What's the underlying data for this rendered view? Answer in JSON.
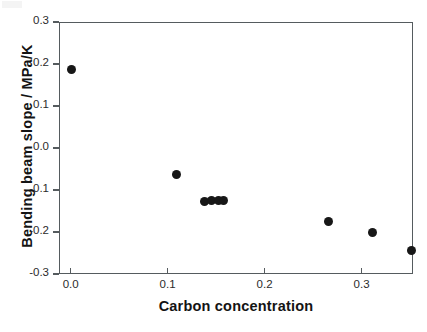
{
  "chart_data": {
    "type": "scatter",
    "title": "",
    "xlabel": "Carbon concentration",
    "ylabel": "Bending beam slope / MPa/K",
    "xlim": [
      -0.012,
      0.353
    ],
    "ylim": [
      -0.3,
      0.3
    ],
    "xticks": [
      0.0,
      0.1,
      0.2,
      0.3
    ],
    "xticklabels": [
      "0.0",
      "0.1",
      "0.2",
      "0.3"
    ],
    "yticks": [
      -0.3,
      -0.2,
      -0.1,
      0.0,
      0.1,
      0.2,
      0.3
    ],
    "yticklabels": [
      "-0.3",
      "-0.2",
      "-0.1",
      "0.0",
      "0.1",
      "0.2",
      "0.3"
    ],
    "grid": false,
    "legend": null,
    "marker": "filled-circle",
    "marker_color": "#171717",
    "frame_color": "#555b5e",
    "background": "#ffffff",
    "series": [
      {
        "name": "Bending beam slope",
        "x": [
          0.001,
          0.109,
          0.138,
          0.145,
          0.152,
          0.158,
          0.266,
          0.311,
          0.351
        ],
        "y": [
          0.186,
          -0.063,
          -0.127,
          -0.124,
          -0.126,
          -0.125,
          -0.174,
          -0.2,
          -0.245
        ]
      }
    ]
  }
}
